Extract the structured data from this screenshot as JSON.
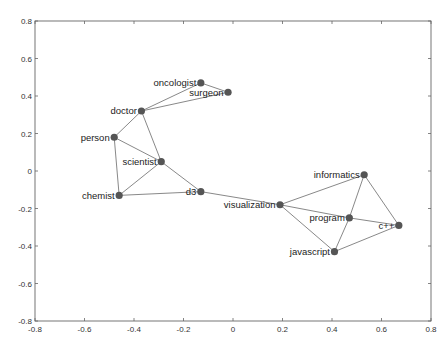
{
  "chart_data": {
    "type": "scatter",
    "subtype": "network-graph-2d-embedding",
    "title": "",
    "xlabel": "",
    "ylabel": "",
    "xlim": [
      -0.8,
      0.8
    ],
    "ylim": [
      -0.8,
      0.8
    ],
    "grid": false,
    "legend": null,
    "x_ticks": [
      "-0.8",
      "-0.6",
      "-0.4",
      "-0.2",
      "0",
      "0.2",
      "0.4",
      "0.6",
      "0.8"
    ],
    "y_ticks": [
      "0.8",
      "0.6",
      "0.4",
      "0.2",
      "0",
      "-0.2",
      "-0.4",
      "-0.6",
      "-0.8"
    ],
    "nodes": [
      {
        "id": "oncologist",
        "label": "oncologist",
        "x": -0.13,
        "y": 0.47,
        "label_side": "left"
      },
      {
        "id": "surgeon",
        "label": "surgeon",
        "x": -0.02,
        "y": 0.42,
        "label_side": "left"
      },
      {
        "id": "doctor",
        "label": "doctor",
        "x": -0.37,
        "y": 0.32,
        "label_side": "left"
      },
      {
        "id": "person",
        "label": "person",
        "x": -0.48,
        "y": 0.18,
        "label_side": "left"
      },
      {
        "id": "scientist",
        "label": "scientist",
        "x": -0.29,
        "y": 0.05,
        "label_side": "left"
      },
      {
        "id": "chemist",
        "label": "chemist",
        "x": -0.46,
        "y": -0.13,
        "label_side": "left"
      },
      {
        "id": "d3",
        "label": "d3",
        "x": -0.13,
        "y": -0.11,
        "label_side": "left"
      },
      {
        "id": "visualization",
        "label": "visualization",
        "x": 0.19,
        "y": -0.18,
        "label_side": "left"
      },
      {
        "id": "informatics",
        "label": "informatics",
        "x": 0.53,
        "y": -0.02,
        "label_side": "left"
      },
      {
        "id": "program",
        "label": "program",
        "x": 0.47,
        "y": -0.25,
        "label_side": "left"
      },
      {
        "id": "cpp",
        "label": "c++",
        "x": 0.67,
        "y": -0.29,
        "label_side": "left"
      },
      {
        "id": "javascript",
        "label": "javascript",
        "x": 0.41,
        "y": -0.43,
        "label_side": "left"
      }
    ],
    "edges": [
      [
        "oncologist",
        "surgeon"
      ],
      [
        "oncologist",
        "doctor"
      ],
      [
        "surgeon",
        "doctor"
      ],
      [
        "doctor",
        "person"
      ],
      [
        "doctor",
        "scientist"
      ],
      [
        "person",
        "scientist"
      ],
      [
        "person",
        "chemist"
      ],
      [
        "scientist",
        "chemist"
      ],
      [
        "scientist",
        "d3"
      ],
      [
        "chemist",
        "d3"
      ],
      [
        "d3",
        "visualization"
      ],
      [
        "visualization",
        "informatics"
      ],
      [
        "visualization",
        "program"
      ],
      [
        "visualization",
        "javascript"
      ],
      [
        "informatics",
        "program"
      ],
      [
        "informatics",
        "cpp"
      ],
      [
        "program",
        "cpp"
      ],
      [
        "program",
        "javascript"
      ],
      [
        "javascript",
        "cpp"
      ]
    ]
  },
  "colors": {
    "node": "#555555",
    "edge": "#7a7a7a",
    "axis": "#666666",
    "text": "#222222",
    "background": "#ffffff"
  }
}
